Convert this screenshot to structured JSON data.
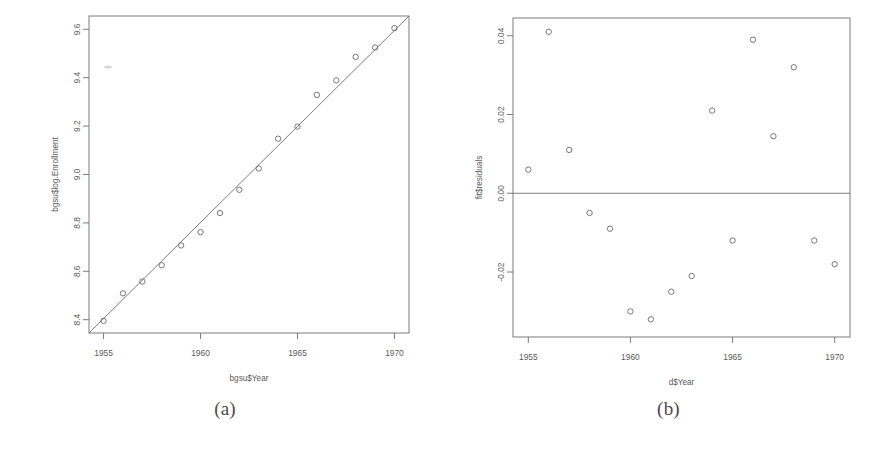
{
  "figure": {
    "panels": [
      {
        "id": "a",
        "caption": "(a)"
      },
      {
        "id": "b",
        "caption": "(b)"
      }
    ]
  },
  "chart_data": [
    {
      "panel": "a",
      "caption": "(a)",
      "type": "scatter",
      "title": "",
      "xlabel": "bgsu$Year",
      "ylabel": "bgsu$log.Enrollment",
      "xlim": [
        1954.25,
        1970.75
      ],
      "ylim": [
        8.345,
        9.655
      ],
      "xticks": [
        1955,
        1960,
        1965,
        1970
      ],
      "xticklabels": [
        "1955",
        "1960",
        "1965",
        "1970"
      ],
      "yticks": [
        8.4,
        8.6,
        8.8,
        9.0,
        9.2,
        9.4,
        9.6
      ],
      "yticklabels": [
        "8.4",
        "8.6",
        "8.8",
        "9.0",
        "9.2",
        "9.4",
        "9.6"
      ],
      "grid": false,
      "legend": "none",
      "x": [
        1955,
        1956,
        1957,
        1958,
        1959,
        1960,
        1961,
        1962,
        1963,
        1964,
        1965,
        1966,
        1967,
        1968,
        1969,
        1970
      ],
      "y": [
        8.395,
        8.509,
        8.558,
        8.625,
        8.707,
        8.762,
        8.841,
        8.937,
        9.025,
        9.148,
        9.198,
        9.329,
        9.389,
        9.486,
        9.525,
        9.605
      ],
      "series": [
        {
          "name": "log.Enrollment",
          "marker": "open-circle",
          "values": [
            8.395,
            8.509,
            8.558,
            8.625,
            8.707,
            8.762,
            8.841,
            8.937,
            9.025,
            9.148,
            9.198,
            9.329,
            9.389,
            9.486,
            9.525,
            9.605
          ]
        },
        {
          "name": "least-squares fit line",
          "type": "line",
          "endpoints": [
            [
              1954.25,
              8.345
            ],
            [
              1970.75,
              9.655
            ]
          ]
        }
      ]
    },
    {
      "panel": "b",
      "caption": "(b)",
      "type": "scatter",
      "title": "",
      "xlabel": "d$Year",
      "ylabel": "fit$residuals",
      "xlim": [
        1954.25,
        1970.75
      ],
      "ylim": [
        -0.0365,
        0.0445
      ],
      "xticks": [
        1955,
        1960,
        1965,
        1970
      ],
      "xticklabels": [
        "1955",
        "1960",
        "1965",
        "1970"
      ],
      "yticks": [
        -0.02,
        0.0,
        0.02,
        0.04
      ],
      "yticklabels": [
        "-0.02",
        "0.00",
        "0.02",
        "0.04"
      ],
      "grid": false,
      "legend": "none",
      "reference_line": {
        "orientation": "horizontal",
        "value": 0.0
      },
      "x": [
        1955,
        1956,
        1957,
        1958,
        1959,
        1960,
        1961,
        1962,
        1963,
        1964,
        1965,
        1966,
        1967,
        1968,
        1969,
        1970
      ],
      "y": [
        0.006,
        0.041,
        0.011,
        -0.005,
        -0.009,
        -0.03,
        -0.032,
        -0.025,
        -0.021,
        0.021,
        -0.012,
        0.039,
        0.0145,
        0.032,
        -0.012,
        -0.018
      ],
      "series": [
        {
          "name": "residuals",
          "marker": "open-circle",
          "values": [
            0.006,
            0.041,
            0.011,
            -0.005,
            -0.009,
            -0.03,
            -0.032,
            -0.025,
            -0.021,
            0.021,
            -0.012,
            0.039,
            0.0145,
            0.032,
            -0.012,
            -0.018
          ]
        }
      ]
    }
  ]
}
